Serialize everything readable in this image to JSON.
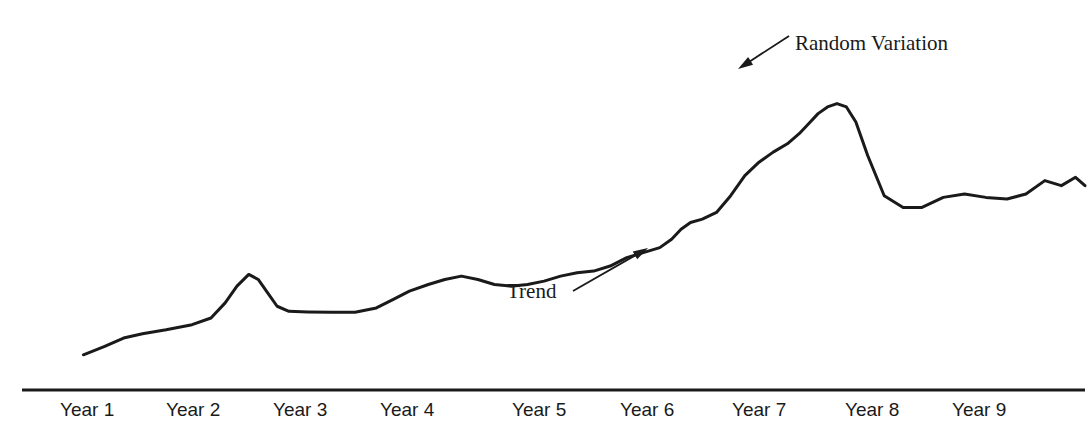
{
  "chart_data": {
    "type": "line",
    "title": "",
    "subtitle": "",
    "xlabel": "",
    "ylabel": "",
    "grid": false,
    "legend": "none",
    "axis": {
      "x_axis_visible": true,
      "y_axis_visible": false,
      "x_axis_line_color": "#1a1a1a"
    },
    "categories": [
      "Year 1",
      "Year 2",
      "Year 3",
      "Year 4",
      "Year 5",
      "Year 6",
      "Year 7",
      "Year 8",
      "Year 9"
    ],
    "xlim": [
      0,
      9
    ],
    "ylim": [
      0,
      100
    ],
    "series": [
      {
        "name": "Demand",
        "color": "#1a1a1a",
        "line_width": 3,
        "x": [
          0.52,
          0.7,
          0.86,
          1.02,
          1.22,
          1.44,
          1.6,
          1.72,
          1.82,
          1.92,
          2.0,
          2.08,
          2.16,
          2.26,
          2.42,
          2.62,
          2.82,
          3.0,
          3.14,
          3.28,
          3.44,
          3.58,
          3.72,
          3.86,
          4.0,
          4.14,
          4.28,
          4.42,
          4.56,
          4.7,
          4.84,
          4.98,
          5.12,
          5.26,
          5.4,
          5.5,
          5.58,
          5.66,
          5.76,
          5.88,
          6.0,
          6.12,
          6.24,
          6.36,
          6.48,
          6.58,
          6.66,
          6.74,
          6.82,
          6.9,
          6.98,
          7.06,
          7.16,
          7.3,
          7.46,
          7.62,
          7.8,
          7.98,
          8.16,
          8.34,
          8.5,
          8.66,
          8.8,
          8.92,
          9.0
        ],
        "y": [
          10.5,
          13.0,
          15.5,
          16.8,
          18.0,
          19.5,
          21.5,
          26.0,
          31.0,
          34.5,
          33.0,
          29.0,
          25.0,
          23.5,
          23.3,
          23.2,
          23.2,
          24.5,
          27.0,
          29.5,
          31.5,
          33.0,
          34.0,
          33.0,
          31.5,
          31.0,
          31.5,
          32.5,
          34.0,
          35.0,
          35.5,
          37.0,
          39.5,
          41.0,
          42.5,
          45.0,
          48.0,
          50.0,
          51.0,
          53.0,
          58.0,
          64.0,
          68.0,
          71.0,
          73.5,
          76.5,
          79.5,
          82.5,
          84.5,
          85.5,
          84.5,
          80.0,
          70.0,
          58.0,
          54.5,
          54.5,
          57.5,
          58.5,
          57.5,
          57.0,
          58.5,
          62.5,
          61.0,
          63.5,
          61.0
        ],
        "annotations": [
          {
            "label": "Random Variation",
            "points_to": "peak at Year 7",
            "arrow": "down-left"
          },
          {
            "label": "Trend",
            "points_to": "upward slope between Year 5 and Year 6",
            "arrow": "up-right"
          }
        ]
      }
    ]
  },
  "annotations": {
    "random_variation": {
      "text": "Random Variation",
      "text_x": 795,
      "text_y": 33,
      "arrow_tail_x": 789,
      "arrow_tail_y": 36,
      "arrow_tip_x": 738,
      "arrow_tip_y": 69
    },
    "trend": {
      "text": "Trend",
      "text_x": 507,
      "text_y": 281,
      "arrow_tail_x": 573,
      "arrow_tail_y": 291,
      "arrow_tip_x": 648,
      "arrow_tip_y": 248
    }
  },
  "x_axis": {
    "line_y": 390,
    "line_x_start": 22,
    "line_x_end": 1085,
    "labels": [
      {
        "text": "Year 1",
        "x": 60
      },
      {
        "text": "Year 2",
        "x": 166
      },
      {
        "text": "Year 3",
        "x": 273
      },
      {
        "text": "Year 4",
        "x": 380
      },
      {
        "text": "Year 5",
        "x": 512
      },
      {
        "text": "Year 6",
        "x": 620
      },
      {
        "text": "Year 7",
        "x": 732
      },
      {
        "text": "Year 8",
        "x": 845
      },
      {
        "text": "Year 9",
        "x": 952
      }
    ],
    "label_y": 400
  },
  "colors": {
    "line": "#1a1a1a",
    "axis": "#1a1a1a",
    "text": "#1a1a1a",
    "background": "#ffffff"
  }
}
